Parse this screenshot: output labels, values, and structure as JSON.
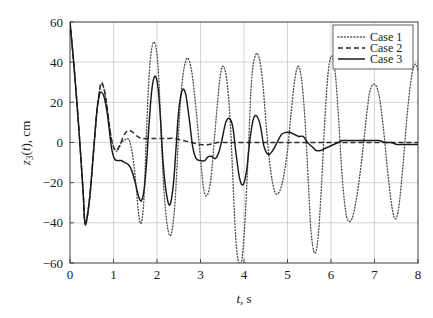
{
  "chart_data": {
    "type": "line",
    "title": "",
    "subtitle": "",
    "xlabel": "t, s",
    "xlabel_parts": {
      "symbol": "t",
      "unit": ", s"
    },
    "ylabel": "z3(t), cm",
    "ylabel_parts": {
      "symbol": "z",
      "subscript": "3",
      "arg": "(t)",
      "unit": ", cm"
    },
    "xlim": [
      0,
      8
    ],
    "ylim": [
      -60,
      60
    ],
    "xticks": [
      0,
      1,
      2,
      3,
      4,
      5,
      6,
      7,
      8
    ],
    "yticks": [
      -60,
      -40,
      -20,
      0,
      20,
      40,
      60
    ],
    "xtick_labels": [
      "0",
      "1",
      "2",
      "3",
      "4",
      "5",
      "6",
      "7",
      "8"
    ],
    "ytick_labels": [
      "-60",
      "-40",
      "-20",
      "0",
      "20",
      "40",
      "60"
    ],
    "grid": true,
    "grid_color": "#b8b8b8",
    "axis_color": "#3a3a3a",
    "background": "#ffffff",
    "legend_position": "top-right",
    "series": [
      {
        "name": "Case 1",
        "style": "dotted",
        "color": "#4d4d4d",
        "x": [
          0.0,
          0.1,
          0.2,
          0.3,
          0.35,
          0.45,
          0.55,
          0.62,
          0.68,
          0.72,
          0.78,
          0.85,
          0.95,
          1.05,
          1.12,
          1.18,
          1.25,
          1.32,
          1.38,
          1.45,
          1.52,
          1.58,
          1.64,
          1.7,
          1.75,
          1.8,
          1.86,
          1.93,
          2.0,
          2.05,
          2.1,
          2.16,
          2.24,
          2.32,
          2.4,
          2.46,
          2.52,
          2.6,
          2.7,
          2.8,
          2.9,
          3.0,
          3.08,
          3.16,
          3.24,
          3.32,
          3.4,
          3.46,
          3.52,
          3.6,
          3.68,
          3.74,
          3.8,
          3.86,
          3.94,
          4.02,
          4.1,
          4.16,
          4.22,
          4.32,
          4.42,
          4.52,
          4.6,
          4.7,
          4.8,
          4.9,
          5.0,
          5.08,
          5.16,
          5.24,
          5.32,
          5.4,
          5.48,
          5.54,
          5.62,
          5.7,
          5.78,
          5.86,
          5.94,
          6.02,
          6.1,
          6.18,
          6.26,
          6.36,
          6.48,
          6.6,
          6.72,
          6.82,
          6.9,
          7.0,
          7.1,
          7.2,
          7.3,
          7.4,
          7.48,
          7.56,
          7.66,
          7.76,
          7.86,
          7.94,
          8.0
        ],
        "y": [
          60,
          36,
          8,
          -24,
          -40,
          -28,
          -2,
          16,
          26,
          29,
          27,
          18,
          2,
          -4,
          -3,
          0,
          1,
          2,
          0,
          -8,
          -22,
          -36,
          -40,
          -28,
          0,
          26,
          44,
          50,
          44,
          28,
          2,
          -24,
          -42,
          -46,
          -34,
          -12,
          14,
          34,
          42,
          35,
          16,
          -8,
          -24,
          -26,
          -18,
          2,
          22,
          34,
          38,
          32,
          12,
          -16,
          -44,
          -58,
          -60,
          -40,
          -4,
          26,
          40,
          44,
          32,
          6,
          -12,
          -24,
          -25,
          -18,
          -4,
          14,
          30,
          38,
          32,
          12,
          -20,
          -44,
          -55,
          -48,
          -22,
          12,
          36,
          43,
          34,
          10,
          -18,
          -37,
          -38,
          -26,
          -6,
          14,
          26,
          29,
          24,
          8,
          -14,
          -32,
          -38,
          -32,
          -10,
          16,
          34,
          39,
          36
        ]
      },
      {
        "name": "Case 2",
        "style": "dashed",
        "color": "#2a2a2a",
        "x": [
          0.0,
          0.1,
          0.2,
          0.3,
          0.35,
          0.45,
          0.55,
          0.62,
          0.68,
          0.72,
          0.78,
          0.85,
          0.95,
          1.05,
          1.15,
          1.25,
          1.35,
          1.45,
          1.55,
          1.65,
          1.75,
          1.85,
          1.95,
          2.05,
          2.2,
          2.4,
          2.6,
          2.8,
          3.0,
          3.2,
          3.4,
          3.6,
          3.8,
          4.0,
          4.2,
          4.4,
          4.6,
          4.8,
          5.0,
          5.2,
          5.4,
          5.6,
          5.8,
          6.0,
          6.2,
          6.4,
          6.6,
          6.8,
          7.0,
          7.2,
          7.4,
          7.6,
          7.8,
          8.0
        ],
        "y": [
          60,
          36,
          8,
          -24,
          -40,
          -28,
          -2,
          16,
          26,
          30,
          27,
          18,
          2,
          -4,
          -1,
          4,
          6,
          5,
          3,
          2,
          2,
          2,
          2,
          2,
          2,
          2,
          1,
          0,
          -1,
          -1,
          0,
          0,
          0,
          0,
          0,
          0,
          0,
          0,
          0,
          0,
          0,
          0,
          0,
          0,
          0,
          0,
          0,
          0,
          0,
          0,
          0,
          0,
          0,
          0
        ]
      },
      {
        "name": "Case 3",
        "style": "solid",
        "color": "#1a1a1a",
        "x": [
          0.0,
          0.1,
          0.2,
          0.3,
          0.35,
          0.45,
          0.55,
          0.62,
          0.68,
          0.72,
          0.78,
          0.86,
          0.95,
          1.02,
          1.1,
          1.18,
          1.26,
          1.34,
          1.42,
          1.5,
          1.58,
          1.64,
          1.7,
          1.76,
          1.82,
          1.88,
          1.95,
          2.02,
          2.08,
          2.14,
          2.22,
          2.3,
          2.38,
          2.44,
          2.5,
          2.58,
          2.66,
          2.74,
          2.82,
          2.9,
          3.0,
          3.1,
          3.18,
          3.26,
          3.34,
          3.42,
          3.5,
          3.58,
          3.66,
          3.74,
          3.82,
          3.9,
          3.98,
          4.06,
          4.14,
          4.22,
          4.3,
          4.38,
          4.46,
          4.56,
          4.66,
          4.76,
          4.86,
          4.96,
          5.06,
          5.16,
          5.26,
          5.36,
          5.46,
          5.56,
          5.66,
          5.76,
          5.86,
          5.96,
          6.06,
          6.16,
          6.26,
          6.4,
          6.54,
          6.68,
          6.82,
          6.96,
          7.1,
          7.24,
          7.38,
          7.52,
          7.66,
          7.8,
          7.92,
          8.0
        ],
        "y": [
          60,
          36,
          8,
          -24,
          -41,
          -28,
          -2,
          16,
          24,
          25,
          23,
          14,
          -2,
          -8,
          -9,
          -9,
          -10,
          -11,
          -14,
          -20,
          -27,
          -29,
          -24,
          -10,
          10,
          26,
          33,
          28,
          12,
          -10,
          -26,
          -31,
          -20,
          -2,
          16,
          26,
          24,
          12,
          -2,
          -8,
          -9,
          -9,
          -7,
          -7,
          -8,
          -5,
          2,
          10,
          12,
          8,
          -6,
          -18,
          -21,
          -14,
          2,
          12,
          13,
          8,
          -2,
          -6,
          -4,
          0,
          4,
          5,
          5,
          4,
          3,
          3,
          0,
          -2,
          -4,
          -4,
          -3,
          -2,
          -1,
          0,
          1,
          1,
          1,
          1,
          1,
          1,
          1,
          0,
          0,
          -1,
          -1,
          -1,
          -1,
          -1
        ]
      }
    ],
    "legend": [
      {
        "label": "Case 1",
        "style": "dotted"
      },
      {
        "label": "Case 2",
        "style": "dashed"
      },
      {
        "label": "Case 3",
        "style": "solid"
      }
    ]
  }
}
